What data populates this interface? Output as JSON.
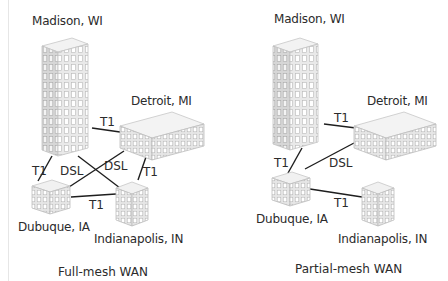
{
  "diagrams": [
    {
      "caption": "Full-mesh WAN",
      "sites": {
        "madison": "Madison, WI",
        "detroit": "Detroit, MI",
        "dubuque": "Dubuque, IA",
        "indianapolis": "Indianapolis, IN"
      },
      "links": [
        {
          "from": "Madison, WI",
          "to": "Detroit, MI",
          "type": "T1"
        },
        {
          "from": "Madison, WI",
          "to": "Dubuque, IA",
          "type": "T1"
        },
        {
          "from": "Madison, WI",
          "to": "Indianapolis, IN",
          "type": "DSL"
        },
        {
          "from": "Detroit, MI",
          "to": "Dubuque, IA",
          "type": "DSL"
        },
        {
          "from": "Detroit, MI",
          "to": "Indianapolis, IN",
          "type": "T1"
        },
        {
          "from": "Dubuque, IA",
          "to": "Indianapolis, IN",
          "type": "T1"
        }
      ],
      "link_labels": {
        "madison_detroit": "T1",
        "madison_dubuque": "T1",
        "dsl_left": "DSL",
        "dsl_right": "DSL",
        "detroit_indianapolis": "T1",
        "dubuque_indianapolis": "T1"
      }
    },
    {
      "caption": "Partial-mesh WAN",
      "sites": {
        "madison": "Madison, WI",
        "detroit": "Detroit, MI",
        "dubuque": "Dubuque, IA",
        "indianapolis": "Indianapolis, IN"
      },
      "links": [
        {
          "from": "Madison, WI",
          "to": "Detroit, MI",
          "type": "T1"
        },
        {
          "from": "Madison, WI",
          "to": "Dubuque, IA",
          "type": "T1"
        },
        {
          "from": "Detroit, MI",
          "to": "Dubuque, IA",
          "type": "DSL"
        },
        {
          "from": "Dubuque, IA",
          "to": "Indianapolis, IN",
          "type": "T1"
        }
      ],
      "link_labels": {
        "madison_detroit": "T1",
        "madison_dubuque": "T1",
        "detroit_dubuque": "DSL",
        "dubuque_indianapolis": "T1"
      }
    }
  ]
}
